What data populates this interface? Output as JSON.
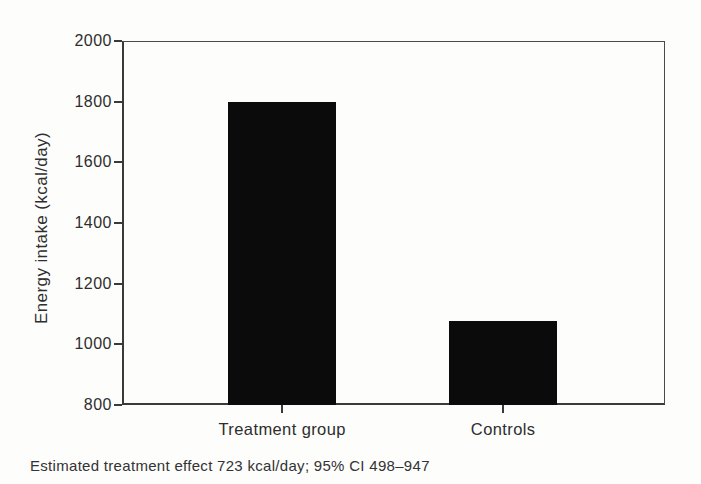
{
  "figure": {
    "background": "#fdfdfc",
    "axis_color": "#3a3a3a",
    "text_color": "#2e2e2e"
  },
  "chart_data": {
    "type": "bar",
    "categories": [
      "Treatment group",
      "Controls"
    ],
    "values": [
      1800,
      1077
    ],
    "title": "",
    "xlabel": "",
    "ylabel": "Energy intake (kcal/day)",
    "ylim": [
      800,
      2000
    ],
    "yticks": [
      800,
      1000,
      1200,
      1400,
      1600,
      1800,
      2000
    ],
    "grid": false,
    "legend": "none",
    "bar_color": "#0b0b0b",
    "annotation": "Estimated treatment effect 723 kcal/day; 95% CI 498–947"
  }
}
